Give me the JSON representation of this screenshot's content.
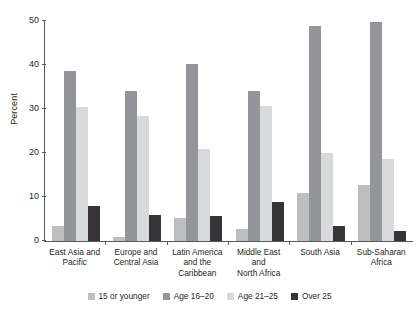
{
  "chart_data": {
    "type": "bar",
    "title": "",
    "subtitle": "",
    "xlabel": "",
    "ylabel": "Percent",
    "ylim": [
      0,
      50
    ],
    "yticks": [
      0,
      10,
      20,
      30,
      40,
      50
    ],
    "grid": false,
    "legend_position": "bottom",
    "categories": [
      "East Asia and Pacific",
      "Europe and Central Asia",
      "Latin America and the Caribbean",
      "Middle East and North Africa",
      "South Asia",
      "Sub-Saharan Africa"
    ],
    "category_lines": [
      [
        "East Asia and",
        "Pacific"
      ],
      [
        "Europe and",
        "Central Asia"
      ],
      [
        "Latin America",
        "and the",
        "Caribbean"
      ],
      [
        "Middle East",
        "and",
        "North Africa"
      ],
      [
        "South Asia"
      ],
      [
        "Sub-Saharan",
        "Africa"
      ]
    ],
    "series": [
      {
        "name": "15 or younger",
        "color": "#bcbec0",
        "values": [
          3.3,
          0.8,
          5.3,
          2.8,
          10.8,
          12.7
        ]
      },
      {
        "name": "Age 16–20",
        "color": "#939598",
        "values": [
          38.6,
          34.2,
          40.3,
          34.0,
          48.8,
          49.8
        ]
      },
      {
        "name": "Age 21–25",
        "color": "#d8d9da",
        "values": [
          30.4,
          28.5,
          20.8,
          30.6,
          20.0,
          18.7
        ]
      },
      {
        "name": "Over 25",
        "color": "#363436",
        "values": [
          7.9,
          6.0,
          5.7,
          8.8,
          3.3,
          2.3
        ]
      }
    ]
  }
}
